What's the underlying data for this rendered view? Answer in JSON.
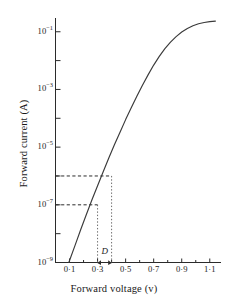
{
  "chart_data": {
    "type": "line",
    "title": "",
    "xlabel": "Forward voltage (v)",
    "ylabel": "Forward current (A)",
    "yscale": "log",
    "xlim": [
      0.0,
      1.18
    ],
    "ylim": [
      1e-09,
      0.3
    ],
    "grid": false,
    "legend": null,
    "x_ticks": [
      {
        "value": 0.1,
        "label": "0·1"
      },
      {
        "value": 0.3,
        "label": "0·3"
      },
      {
        "value": 0.5,
        "label": "0·5"
      },
      {
        "value": 0.7,
        "label": "0·7"
      },
      {
        "value": 0.9,
        "label": "0·9"
      },
      {
        "value": 1.1,
        "label": "1·1"
      }
    ],
    "x_minor_ticks": [
      0.2,
      0.4,
      0.6,
      0.8,
      1.0
    ],
    "y_ticks": [
      {
        "value": 0.1,
        "label": "10",
        "exp": "−1"
      },
      {
        "value": 0.001,
        "label": "10",
        "exp": "−3"
      },
      {
        "value": 1e-05,
        "label": "10",
        "exp": "−5"
      },
      {
        "value": 1e-07,
        "label": "10",
        "exp": "−7"
      },
      {
        "value": 1e-09,
        "label": "10",
        "exp": "−9"
      }
    ],
    "y_minor_ticks": [
      0.01,
      0.0001,
      1e-06,
      1e-08
    ],
    "series": [
      {
        "name": "forward characteristic",
        "x": [
          0.095,
          0.14,
          0.18,
          0.22,
          0.26,
          0.3,
          0.34,
          0.38,
          0.42,
          0.46,
          0.5,
          0.54,
          0.58,
          0.62,
          0.66,
          0.7,
          0.74,
          0.78,
          0.82,
          0.86,
          0.9,
          0.94,
          0.98,
          1.02,
          1.06,
          1.1,
          1.14
        ],
        "y": [
          1e-09,
          4e-09,
          1.4e-08,
          4.6e-08,
          1.5e-07,
          4.6e-07,
          1.4e-06,
          4.2e-06,
          1.2e-05,
          3.3e-05,
          9e-05,
          0.00023,
          0.00058,
          0.0014,
          0.0032,
          0.007,
          0.014,
          0.026,
          0.044,
          0.068,
          0.098,
          0.13,
          0.162,
          0.19,
          0.21,
          0.225,
          0.235
        ]
      }
    ],
    "annotations": [
      {
        "name": "construction-upper",
        "type": "dashed-horizontal-to-curve",
        "y": 1e-06,
        "x_at_curve": 0.4
      },
      {
        "name": "construction-lower",
        "type": "dashed-horizontal-to-curve",
        "y": 1e-07,
        "x_at_curve": 0.3
      },
      {
        "name": "drop-line-left",
        "type": "dotted-vertical",
        "x": 0.3
      },
      {
        "name": "drop-line-right",
        "type": "dotted-vertical",
        "x": 0.4
      },
      {
        "name": "delta-label",
        "type": "text",
        "text": "D",
        "x": 0.35,
        "y_px": 247
      }
    ]
  },
  "axes": {
    "ylabel": "Forward current (A)",
    "xlabel": "Forward voltage (v)"
  },
  "labels": {
    "d_marker": "D"
  }
}
